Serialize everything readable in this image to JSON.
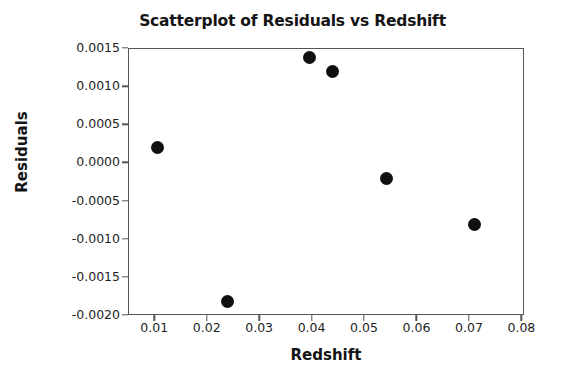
{
  "chart_data": {
    "type": "scatter",
    "title": "Scatterplot of Residuals vs Redshift",
    "xlabel": "Redshift",
    "ylabel": "Residuals",
    "xlim": [
      0.005,
      0.0805
    ],
    "ylim": [
      -0.002,
      0.0015
    ],
    "grid": false,
    "legend": null,
    "marker": {
      "shape": "circle",
      "color": "#101010",
      "size_px": 13
    },
    "x_ticks": [
      0.01,
      0.02,
      0.03,
      0.04,
      0.05,
      0.06,
      0.07,
      0.08
    ],
    "x_tick_labels": [
      "0.01",
      "0.02",
      "0.03",
      "0.04",
      "0.05",
      "0.06",
      "0.07",
      "0.08"
    ],
    "y_ticks": [
      0.0015,
      0.001,
      0.0005,
      0.0,
      -0.0005,
      -0.001,
      -0.0015,
      -0.002
    ],
    "y_tick_labels": [
      "0.0015",
      "0.0010",
      "0.0005",
      "0.0000",
      "-0.0005",
      "-0.0010",
      "-0.0015",
      "-0.0020"
    ],
    "points": [
      {
        "x": 0.0106,
        "y": 0.00019
      },
      {
        "x": 0.0239,
        "y": -0.00182
      },
      {
        "x": 0.0396,
        "y": 0.00138
      },
      {
        "x": 0.044,
        "y": 0.00119
      },
      {
        "x": 0.0542,
        "y": -0.00021
      },
      {
        "x": 0.0711,
        "y": -0.00081
      }
    ],
    "x": [
      0.0106,
      0.0239,
      0.0396,
      0.044,
      0.0542,
      0.0711
    ],
    "values": [
      0.00019,
      -0.00182,
      0.00138,
      0.00119,
      -0.00021,
      -0.00081
    ]
  },
  "colors": {
    "marker": "#101010",
    "axis": "#555555",
    "text": "#1a1a1a",
    "background": "#ffffff"
  }
}
